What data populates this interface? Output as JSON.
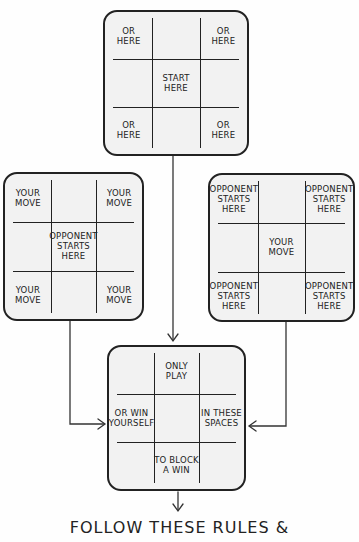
{
  "boards": {
    "top": {
      "title": "start",
      "cells": [
        "OR\nHERE",
        "",
        "OR\nHERE",
        "",
        "START\nHERE",
        "",
        "OR\nHERE",
        "",
        "OR\nHERE"
      ]
    },
    "left": {
      "title": "opponent-center",
      "cells": [
        "YOUR\nMOVE",
        "",
        "YOUR\nMOVE",
        "",
        "OPPONENT\nSTARTS\nHERE",
        "",
        "YOUR\nMOVE",
        "",
        "YOUR\nMOVE"
      ]
    },
    "right": {
      "title": "opponent-corners",
      "cells": [
        "OPPONENT\nSTARTS\nHERE",
        "",
        "OPPONENT\nSTARTS\nHERE",
        "",
        "YOUR\nMOVE",
        "",
        "OPPONENT\nSTARTS\nHERE",
        "",
        "OPPONENT\nSTARTS\nHERE"
      ]
    },
    "bottom": {
      "title": "rules",
      "cells": [
        "",
        "ONLY\nPLAY",
        "",
        "OR WIN\nYOURSELF",
        "",
        "IN THESE\nSPACES",
        "",
        "TO BLOCK\nA WIN",
        ""
      ]
    }
  },
  "footer": {
    "text": "FOLLOW THESE RULES &"
  },
  "colors": {
    "ink": "#222222",
    "board_fill": "#f2f2f2",
    "background": "#fefefe"
  }
}
